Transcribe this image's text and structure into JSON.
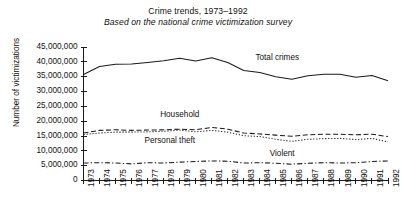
{
  "chart_data": {
    "type": "line",
    "title": "Crime trends, 1973–1992",
    "subtitle": "Based on the national crime victimization survey",
    "xlabel": "",
    "ylabel": "Number of victimizations",
    "grid": false,
    "legend_position": "inline-annotations",
    "xlim": [
      1973,
      1992
    ],
    "ylim": [
      0,
      45000000
    ],
    "ytick_step": 5000000,
    "categories": [
      1973,
      1974,
      1975,
      1976,
      1977,
      1978,
      1979,
      1980,
      1981,
      1982,
      1983,
      1984,
      1985,
      1986,
      1987,
      1988,
      1989,
      1990,
      1991,
      1992
    ],
    "xtick_labels": [
      "1973",
      "1974",
      "1975",
      "1976",
      "1977",
      "1978",
      "1979",
      "1980",
      "1981",
      "1982",
      "1983",
      "1984",
      "1985",
      "1986",
      "1987",
      "1988",
      "1989",
      "1990",
      "1991",
      "1992"
    ],
    "ytick_labels": [
      "0",
      "5,000,000",
      "10,000,000",
      "15,000,000",
      "20,000,000",
      "25,000,000",
      "30,000,000",
      "35,000,000",
      "40,000,000",
      "45,000,000"
    ],
    "ytick_values": [
      0,
      5000000,
      10000000,
      15000000,
      20000000,
      25000000,
      30000000,
      35000000,
      40000000,
      45000000
    ],
    "series": [
      {
        "name": "Total crimes",
        "style": "solid",
        "color": "#1a1a1a",
        "label_x": 1985.1,
        "label_y": 41200000,
        "values": [
          35700000,
          38400000,
          39200000,
          39300000,
          39800000,
          40400000,
          41200000,
          40300000,
          41400000,
          39800000,
          37100000,
          36400000,
          35000000,
          34100000,
          35300000,
          35800000,
          35800000,
          34800000,
          35400000,
          33600000
        ]
      },
      {
        "name": "Household",
        "style": "dashed",
        "color": "#1a1a1a",
        "label_x": 1979.0,
        "label_y": 22000000,
        "values": [
          16000000,
          16900000,
          17100000,
          16900000,
          17000000,
          17100000,
          17300000,
          17100000,
          17900000,
          17300000,
          16000000,
          15700000,
          15300000,
          14900000,
          15400000,
          15600000,
          15600000,
          15400000,
          15600000,
          14800000
        ]
      },
      {
        "name": "Personal theft",
        "style": "dotted",
        "color": "#1a1a1a",
        "label_x": 1978.4,
        "label_y": 13000000,
        "values": [
          15500000,
          16000000,
          16300000,
          16300000,
          16400000,
          16600000,
          17000000,
          16400000,
          16900000,
          16300000,
          15100000,
          14800000,
          13900000,
          13200000,
          13900000,
          14100000,
          14200000,
          13800000,
          14200000,
          13000000
        ]
      },
      {
        "name": "Violent",
        "style": "dashdot",
        "color": "#1a1a1a",
        "label_x": 1985.4,
        "label_y": 8600000,
        "values": [
          5900000,
          6000000,
          5900000,
          5600000,
          6000000,
          5900000,
          6200000,
          6400000,
          6600000,
          6500000,
          5900000,
          6000000,
          5800000,
          5500000,
          5800000,
          6000000,
          5900000,
          6000000,
          6400000,
          6600000
        ]
      }
    ]
  }
}
